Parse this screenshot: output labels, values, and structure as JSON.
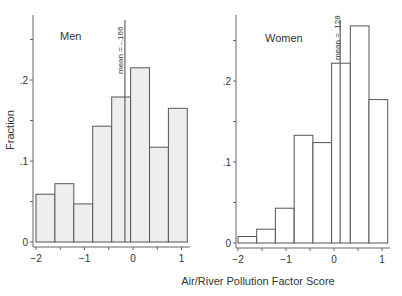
{
  "chart_data": [
    {
      "type": "bar",
      "title": "Men",
      "xlabel": "Air/River Pollution Factor Score",
      "ylabel": "Fraction",
      "bin_edges": [
        -2.0,
        -1.61,
        -1.22,
        -0.83,
        -0.44,
        -0.05,
        0.34,
        0.73,
        1.12
      ],
      "values": [
        0.059,
        0.072,
        0.047,
        0.143,
        0.179,
        0.215,
        0.117,
        0.165
      ],
      "annotation": "mean = -.166",
      "mean": -0.166,
      "xticks": [
        "-2",
        "-1",
        "0",
        "1"
      ],
      "yticks": [
        "0",
        ".1",
        ".2"
      ],
      "xlim": [
        -2,
        1.15
      ],
      "ylim": [
        0,
        0.27
      ],
      "fill": "#eeeeee"
    },
    {
      "type": "bar",
      "title": "Women",
      "xlabel": "Air/River Pollution Factor Score",
      "ylabel": "",
      "bin_edges": [
        -2.0,
        -1.61,
        -1.22,
        -0.83,
        -0.44,
        -0.05,
        0.34,
        0.73,
        1.12
      ],
      "values": [
        0.008,
        0.017,
        0.043,
        0.133,
        0.124,
        0.222,
        0.268,
        0.177
      ],
      "annotation": "mean = .128",
      "mean": 0.128,
      "xticks": [
        "-2",
        "-1",
        "0",
        "1"
      ],
      "yticks": [
        "0",
        ".1",
        ".2"
      ],
      "xlim": [
        -2,
        1.15
      ],
      "ylim": [
        0,
        0.27
      ],
      "fill": "#ffffff"
    }
  ],
  "labels": {
    "panel_left_title": "Men",
    "panel_right_title": "Women",
    "y_axis_title": "Fraction",
    "x_axis_title": "Air/River Pollution Factor Score",
    "mean_left": "mean = -.166",
    "mean_right": "mean = .128",
    "ytick_0": "0",
    "ytick_1": ".1",
    "ytick_2": ".2",
    "xtick_m2": "−2",
    "xtick_m1": "−1",
    "xtick_0": "0",
    "xtick_1": "1"
  }
}
